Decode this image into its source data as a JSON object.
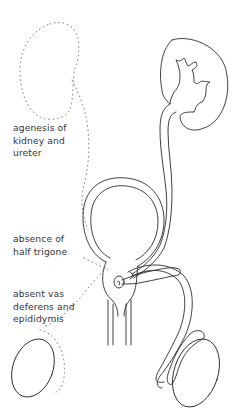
{
  "figure": {
    "type": "anatomical-line-drawing",
    "labels": [
      {
        "id": "kidney-ureter",
        "lines": [
          "agenesis of",
          "kidney and",
          "ureter"
        ]
      },
      {
        "id": "trigone",
        "lines": [
          "absence of",
          "half trigone"
        ]
      },
      {
        "id": "vas-epididymis",
        "lines": [
          "absent vas",
          "deferens and",
          "epididymis"
        ]
      }
    ],
    "colors": {
      "ink": "#2a2a2a",
      "dotted_outline": "#777777",
      "text": "#333333",
      "background": "#ffffff"
    }
  }
}
